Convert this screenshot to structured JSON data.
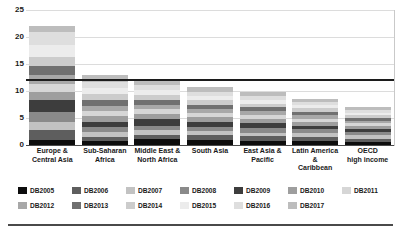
{
  "chart_data": {
    "type": "bar",
    "stacked": true,
    "title": "",
    "subtitle": "",
    "xlabel": "",
    "ylabel": "",
    "ylim": [
      0,
      25
    ],
    "yticks": [
      0,
      5,
      10,
      15,
      20,
      25
    ],
    "ytick_labels": [
      "0",
      "5",
      "10",
      "15",
      "20",
      "25"
    ],
    "grid": true,
    "legend_position": "bottom",
    "reference_line": {
      "value": 12,
      "label": "",
      "color": "#1c1c1c"
    },
    "categories": [
      "Europe &\nCentral Asia",
      "Sub-Saharan\nAfrica",
      "Middle East &\nNorth Africa",
      "South Asia",
      "East Asia &\nPacific",
      "Latin America &\nCaribbean",
      "OECD\nhigh income"
    ],
    "series": [
      {
        "name": "DB2005",
        "color": "#0d0d0d",
        "values": [
          1.0,
          0.7,
          1.1,
          0.9,
          0.7,
          0.7,
          0.5
        ]
      },
      {
        "name": "DB2006",
        "color": "#5e5e5e",
        "values": [
          1.7,
          0.8,
          0.8,
          0.9,
          0.9,
          0.8,
          0.7
        ]
      },
      {
        "name": "DB2007",
        "color": "#c2c2c2",
        "values": [
          1.6,
          0.9,
          0.8,
          0.8,
          0.7,
          0.7,
          0.6
        ]
      },
      {
        "name": "DB2008",
        "color": "#8a8a8a",
        "values": [
          1.8,
          0.9,
          0.9,
          0.8,
          0.8,
          0.7,
          0.6
        ]
      },
      {
        "name": "DB2009",
        "color": "#3d3d3d",
        "values": [
          2.2,
          1.0,
          1.2,
          0.9,
          0.9,
          0.7,
          0.6
        ]
      },
      {
        "name": "DB2010",
        "color": "#9e9e9e",
        "values": [
          1.6,
          1.0,
          0.9,
          0.8,
          0.8,
          0.7,
          0.5
        ]
      },
      {
        "name": "DB2011",
        "color": "#d6d6d6",
        "values": [
          1.5,
          1.0,
          0.9,
          0.8,
          0.8,
          0.6,
          0.5
        ]
      },
      {
        "name": "DB2012",
        "color": "#a8a8a8",
        "values": [
          1.6,
          1.0,
          0.9,
          0.8,
          0.7,
          0.7,
          0.5
        ]
      },
      {
        "name": "DB2013",
        "color": "#707070",
        "values": [
          1.7,
          1.1,
          0.9,
          0.8,
          0.7,
          0.6,
          0.5
        ]
      },
      {
        "name": "DB2014",
        "color": "#cccccc",
        "values": [
          1.6,
          1.0,
          0.9,
          0.8,
          0.7,
          0.6,
          0.5
        ]
      },
      {
        "name": "DB2015",
        "color": "#ececec",
        "values": [
          2.3,
          1.1,
          0.9,
          0.8,
          0.7,
          0.6,
          0.5
        ]
      },
      {
        "name": "DB2016",
        "color": "#dedede",
        "values": [
          2.4,
          1.1,
          0.9,
          0.8,
          0.7,
          0.6,
          0.5
        ]
      },
      {
        "name": "DB2017",
        "color": "#bdbdbd",
        "values": [
          1.0,
          1.4,
          0.9,
          0.9,
          0.7,
          0.6,
          0.5
        ]
      }
    ],
    "totals": [
      22.0,
      13.0,
      11.0,
      10.1,
      9.8,
      8.6,
      7.0
    ]
  }
}
